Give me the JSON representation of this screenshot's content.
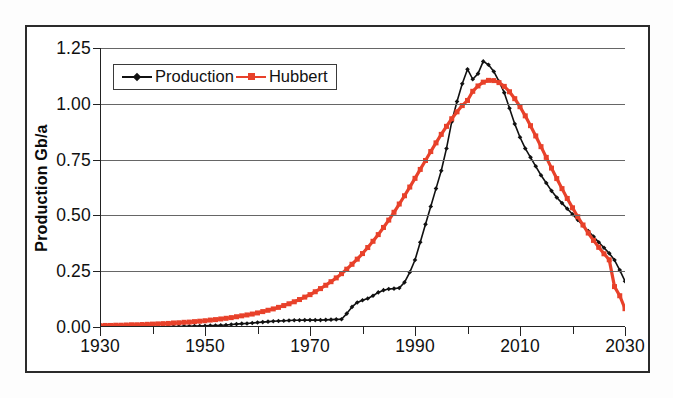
{
  "chart_data": {
    "type": "line",
    "title": "",
    "xlabel": "",
    "ylabel": "Production Gb/a",
    "xlim": [
      1930,
      2030
    ],
    "ylim": [
      0.0,
      1.25
    ],
    "grid": true,
    "legend_position": "top-left inside plot",
    "x_ticks_major": [
      1930,
      1950,
      1970,
      1990,
      2010,
      2030
    ],
    "x_ticks_minor": [
      1940,
      1960,
      1980,
      2000,
      2020
    ],
    "x_tick_labels": [
      "1930",
      "1950",
      "1970",
      "1990",
      "2010",
      "2030"
    ],
    "y_ticks": [
      0.0,
      0.25,
      0.5,
      0.75,
      1.0,
      1.25
    ],
    "y_tick_labels": [
      "0.00",
      "0.25",
      "0.50",
      "0.75",
      "1.00",
      "1.25"
    ],
    "series": [
      {
        "name": "Production",
        "color": "#111111",
        "marker": "diamond",
        "x": [
          1930,
          1931,
          1932,
          1933,
          1934,
          1935,
          1936,
          1937,
          1938,
          1939,
          1940,
          1941,
          1942,
          1943,
          1944,
          1945,
          1946,
          1947,
          1948,
          1949,
          1950,
          1951,
          1952,
          1953,
          1954,
          1955,
          1956,
          1957,
          1958,
          1959,
          1960,
          1961,
          1962,
          1963,
          1964,
          1965,
          1966,
          1967,
          1968,
          1969,
          1970,
          1971,
          1972,
          1973,
          1974,
          1975,
          1976,
          1977,
          1978,
          1979,
          1980,
          1981,
          1982,
          1983,
          1984,
          1985,
          1986,
          1987,
          1988,
          1989,
          1990,
          1991,
          1992,
          1993,
          1994,
          1995,
          1996,
          1997,
          1998,
          1999,
          2000,
          2001,
          2002,
          2003,
          2004,
          2005,
          2006,
          2007,
          2008,
          2009,
          2010,
          2011,
          2012,
          2013,
          2014,
          2015,
          2016,
          2017,
          2018,
          2019,
          2020,
          2021,
          2022,
          2023,
          2024,
          2025,
          2026,
          2027,
          2028,
          2029,
          2030
        ],
        "y": [
          0.0,
          0.0,
          0.0,
          0.0,
          0.0,
          0.0,
          0.0,
          0.001,
          0.001,
          0.001,
          0.001,
          0.001,
          0.001,
          0.002,
          0.002,
          0.002,
          0.003,
          0.003,
          0.004,
          0.004,
          0.005,
          0.006,
          0.007,
          0.008,
          0.009,
          0.011,
          0.013,
          0.015,
          0.016,
          0.018,
          0.02,
          0.022,
          0.024,
          0.026,
          0.027,
          0.028,
          0.029,
          0.03,
          0.03,
          0.031,
          0.031,
          0.031,
          0.031,
          0.032,
          0.033,
          0.034,
          0.035,
          0.06,
          0.09,
          0.11,
          0.12,
          0.128,
          0.14,
          0.155,
          0.165,
          0.17,
          0.172,
          0.175,
          0.2,
          0.245,
          0.3,
          0.38,
          0.46,
          0.54,
          0.62,
          0.7,
          0.8,
          0.92,
          1.01,
          1.09,
          1.155,
          1.11,
          1.135,
          1.19,
          1.175,
          1.145,
          1.1,
          1.05,
          0.98,
          0.91,
          0.85,
          0.8,
          0.76,
          0.72,
          0.68,
          0.645,
          0.61,
          0.58,
          0.555,
          0.53,
          0.505,
          0.48,
          0.455,
          0.43,
          0.405,
          0.38,
          0.355,
          0.33,
          0.3,
          0.255,
          0.205
        ]
      },
      {
        "name": "Hubbert",
        "color": "#E8412A",
        "marker": "square",
        "x": [
          1930,
          1931,
          1932,
          1933,
          1934,
          1935,
          1936,
          1937,
          1938,
          1939,
          1940,
          1941,
          1942,
          1943,
          1944,
          1945,
          1946,
          1947,
          1948,
          1949,
          1950,
          1951,
          1952,
          1953,
          1954,
          1955,
          1956,
          1957,
          1958,
          1959,
          1960,
          1961,
          1962,
          1963,
          1964,
          1965,
          1966,
          1967,
          1968,
          1969,
          1970,
          1971,
          1972,
          1973,
          1974,
          1975,
          1976,
          1977,
          1978,
          1979,
          1980,
          1981,
          1982,
          1983,
          1984,
          1985,
          1986,
          1987,
          1988,
          1989,
          1990,
          1991,
          1992,
          1993,
          1994,
          1995,
          1996,
          1997,
          1998,
          1999,
          2000,
          2001,
          2002,
          2003,
          2004,
          2005,
          2006,
          2007,
          2008,
          2009,
          2010,
          2011,
          2012,
          2013,
          2014,
          2015,
          2016,
          2017,
          2018,
          2019,
          2020,
          2021,
          2022,
          2023,
          2024,
          2025,
          2026,
          2027,
          2028,
          2029,
          2030
        ],
        "y": [
          0.006,
          0.007,
          0.007,
          0.008,
          0.008,
          0.009,
          0.01,
          0.01,
          0.011,
          0.012,
          0.013,
          0.014,
          0.015,
          0.016,
          0.018,
          0.019,
          0.021,
          0.022,
          0.024,
          0.026,
          0.028,
          0.031,
          0.033,
          0.036,
          0.039,
          0.042,
          0.046,
          0.05,
          0.054,
          0.058,
          0.063,
          0.069,
          0.075,
          0.081,
          0.088,
          0.096,
          0.104,
          0.113,
          0.123,
          0.134,
          0.145,
          0.158,
          0.172,
          0.187,
          0.203,
          0.22,
          0.239,
          0.259,
          0.281,
          0.304,
          0.329,
          0.356,
          0.384,
          0.414,
          0.446,
          0.479,
          0.514,
          0.551,
          0.588,
          0.627,
          0.666,
          0.706,
          0.746,
          0.786,
          0.825,
          0.863,
          0.899,
          0.933,
          0.964,
          0.992,
          1.015,
          1.056,
          1.08,
          1.097,
          1.105,
          1.104,
          1.095,
          1.078,
          1.054,
          1.023,
          0.987,
          0.946,
          0.902,
          0.856,
          0.808,
          0.76,
          0.712,
          0.665,
          0.62,
          0.576,
          0.534,
          0.494,
          0.457,
          0.421,
          0.388,
          0.357,
          0.328,
          0.301,
          0.181,
          0.14,
          0.082
        ]
      }
    ]
  },
  "legend": {
    "entries": [
      {
        "label": "Production",
        "color": "#111111",
        "marker": "diamond"
      },
      {
        "label": "Hubbert",
        "color": "#E8412A",
        "marker": "square"
      }
    ]
  },
  "axes": {
    "y_title": "Production Gb/a"
  }
}
